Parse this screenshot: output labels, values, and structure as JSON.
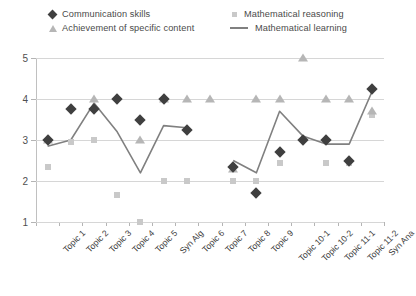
{
  "chart_data": {
    "type": "scatter",
    "title": "",
    "xlabel": "",
    "ylabel": "",
    "ylim": [
      1,
      5
    ],
    "yticks": [
      1,
      2,
      3,
      4,
      5
    ],
    "grid": true,
    "legend_position": "top",
    "categories": [
      "Topic 1",
      "Topic 2",
      "Topic 3",
      "Topic 4",
      "Topic 5",
      "Syn Alg",
      "Topic 6",
      "Topic 7",
      "Topic 8",
      "Topic 9",
      "Topic 10-1",
      "Topic 10-2",
      "Topic 11-1",
      "Topic 11-2",
      "Syn Ana"
    ],
    "series": [
      {
        "name": "Communication skills",
        "marker": "diamond",
        "color": "#3f3f3f",
        "values": [
          3.0,
          3.75,
          3.75,
          4.0,
          3.5,
          4.0,
          3.25,
          null,
          2.35,
          1.7,
          2.7,
          3.0,
          3.0,
          2.5,
          4.25
        ]
      },
      {
        "name": "Achievement of specific content",
        "marker": "triangle",
        "color": "#b6b6b6",
        "values": [
          3.0,
          null,
          4.0,
          null,
          3.0,
          4.0,
          4.0,
          4.0,
          2.3,
          4.0,
          4.0,
          5.0,
          4.0,
          4.0,
          3.7
        ]
      },
      {
        "name": "Mathematical reasoning",
        "marker": "square",
        "color": "#c9c9c9",
        "values": [
          2.35,
          2.95,
          3.0,
          1.65,
          1.0,
          2.0,
          2.0,
          null,
          2.0,
          2.0,
          2.45,
          3.0,
          2.45,
          2.45,
          3.6
        ]
      },
      {
        "name": "Mathematical learning",
        "marker": "line",
        "color": "#808080",
        "values": [
          2.85,
          3.0,
          3.9,
          3.2,
          2.2,
          3.35,
          3.3,
          null,
          2.5,
          2.2,
          3.7,
          3.1,
          2.9,
          2.9,
          4.2
        ]
      }
    ]
  },
  "legend": {
    "entries": [
      {
        "label": "Communication skills",
        "marker": "diamond-icon"
      },
      {
        "label": "Achievement of specific content",
        "marker": "triangle-icon"
      },
      {
        "label": "Mathematical reasoning",
        "marker": "square-icon"
      },
      {
        "label": "Mathematical learning",
        "marker": "line-icon"
      }
    ]
  }
}
